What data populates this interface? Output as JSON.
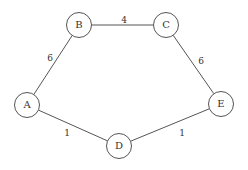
{
  "diagram": {
    "type": "weighted-undirected-graph",
    "style": {
      "stroke": "#555555",
      "text": "#333333",
      "background": "#ffffff",
      "node_fill": "#ffffff"
    },
    "nodes": [
      {
        "id": "A",
        "label": "A",
        "x": 27,
        "y": 105
      },
      {
        "id": "B",
        "label": "B",
        "x": 79,
        "y": 25
      },
      {
        "id": "C",
        "label": "C",
        "x": 166,
        "y": 25
      },
      {
        "id": "D",
        "label": "D",
        "x": 119,
        "y": 146
      },
      {
        "id": "E",
        "label": "E",
        "x": 221,
        "y": 104
      }
    ],
    "edges": [
      {
        "from": "A",
        "to": "B",
        "weight": "6",
        "label_x": 50,
        "label_y": 58
      },
      {
        "from": "B",
        "to": "C",
        "weight": "4",
        "label_x": 124,
        "label_y": 20
      },
      {
        "from": "C",
        "to": "E",
        "weight": "6",
        "label_x": 201,
        "label_y": 61
      },
      {
        "from": "A",
        "to": "D",
        "weight": "1",
        "label_x": 67,
        "label_y": 133
      },
      {
        "from": "D",
        "to": "E",
        "weight": "1",
        "label_x": 182,
        "label_y": 133
      }
    ]
  }
}
